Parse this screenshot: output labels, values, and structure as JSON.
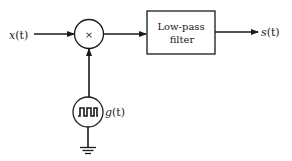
{
  "diagram": {
    "type": "block-diagram",
    "input_label": "x(t)",
    "input_var": "x",
    "input_arg": "(t)",
    "multiplier_symbol": "×",
    "filter_label_line1": "Low-pass",
    "filter_label_line2": "filter",
    "output_label": "s(t)",
    "output_var": "s",
    "output_arg": "(t)",
    "generator_label": "g(t)",
    "generator_var": "g",
    "generator_arg": "(t)",
    "generator_icon": "square-wave-icon",
    "ground_icon": "ground-icon",
    "colors": {
      "stroke": "#1a1a1a",
      "background": "#ffffff"
    }
  }
}
